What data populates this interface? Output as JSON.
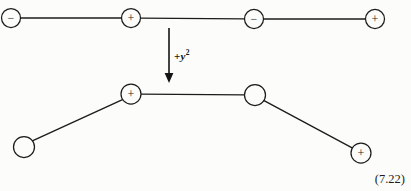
{
  "figure": {
    "equation_number": "(7.22)",
    "operator_label": {
      "operator": "+",
      "variable": "y",
      "exponent": "2"
    },
    "background_color": "#fcfcfa",
    "stroke_color": "#1c1c1c",
    "top_diagram": {
      "name": "top-chain",
      "nodes": [
        {
          "id": "t1",
          "sign": "−",
          "cx": 11,
          "cy": 18,
          "r": 9.5
        },
        {
          "id": "t2",
          "sign": "+",
          "cx": 131,
          "cy": 18,
          "r": 9.5
        },
        {
          "id": "t3",
          "sign": "−",
          "cx": 254,
          "cy": 19,
          "r": 9.5
        },
        {
          "id": "t4",
          "sign": "+",
          "cx": 375,
          "cy": 19,
          "r": 9.5
        }
      ],
      "edges": [
        {
          "from": "t1",
          "to": "t2"
        },
        {
          "from": "t2",
          "to": "t3"
        },
        {
          "from": "t3",
          "to": "t4"
        }
      ]
    },
    "arrow": {
      "name": "transformation-arrow",
      "x": 169,
      "y_start": 28,
      "y_end": 83
    },
    "bottom_diagram": {
      "name": "bottom-chain",
      "nodes": [
        {
          "id": "b1",
          "sign": "",
          "cx": 24,
          "cy": 147,
          "r": 10.5
        },
        {
          "id": "b2",
          "sign": "+",
          "cx": 131,
          "cy": 94,
          "r": 10.0
        },
        {
          "id": "b3",
          "sign": "",
          "cx": 255,
          "cy": 95,
          "r": 10.5
        },
        {
          "id": "b4",
          "sign": "+",
          "cx": 361,
          "cy": 153,
          "r": 10.0
        }
      ],
      "edges": [
        {
          "from": "b1",
          "to": "b2"
        },
        {
          "from": "b2",
          "to": "b3"
        },
        {
          "from": "b3",
          "to": "b4"
        }
      ]
    }
  }
}
